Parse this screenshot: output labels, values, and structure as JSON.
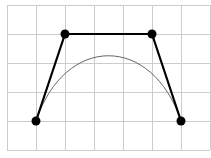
{
  "diagram": {
    "type": "cubic-bezier-curve",
    "grid": {
      "x0": 7,
      "y0": 5,
      "cell": 29,
      "cols": 7,
      "rows": 5,
      "color": "#cccccc"
    },
    "control_points": [
      {
        "x": 36,
        "y": 121
      },
      {
        "x": 65,
        "y": 34
      },
      {
        "x": 152,
        "y": 34
      },
      {
        "x": 181,
        "y": 121
      }
    ],
    "colors": {
      "polygon": "#000000",
      "curve": "#555555",
      "points": "#000000"
    }
  }
}
